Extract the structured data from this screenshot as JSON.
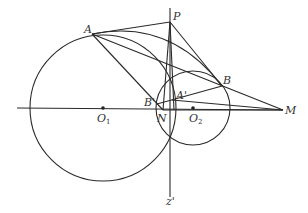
{
  "diagram": {
    "type": "geometry",
    "stroke_color": "#2a2a2a",
    "points": {
      "P": {
        "label": "P",
        "x": 170,
        "y": 22
      },
      "A": {
        "label": "A",
        "x": 92,
        "y": 34
      },
      "B": {
        "label": "B",
        "x": 222,
        "y": 86
      },
      "M": {
        "label": "M",
        "x": 283,
        "y": 110
      },
      "N": {
        "label": "N",
        "x": 164,
        "y": 110
      },
      "B1": {
        "label": "B'",
        "x": 157,
        "y": 104
      },
      "A1": {
        "label": "A'",
        "x": 175,
        "y": 99
      },
      "O1": {
        "label": "O",
        "sub": "1",
        "x": 103,
        "y": 108
      },
      "O2": {
        "label": "O",
        "sub": "2",
        "x": 193,
        "y": 108
      },
      "Z": {
        "label": "z'",
        "x": 170,
        "y": 197
      }
    },
    "circles": [
      {
        "name": "circle-O1",
        "cx": 103,
        "cy": 108,
        "r": 73
      },
      {
        "name": "circle-O2",
        "cx": 193,
        "cy": 108,
        "r": 37
      }
    ]
  }
}
